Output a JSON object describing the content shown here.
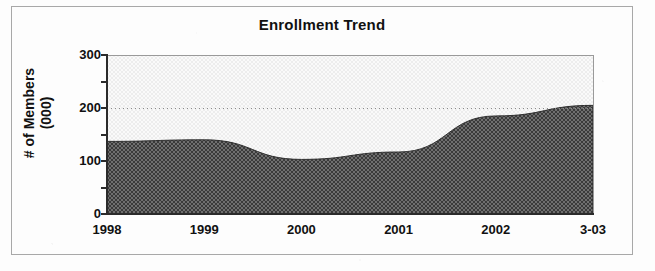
{
  "chart_data": {
    "type": "area",
    "title": "Enrollment Trend",
    "xlabel": "",
    "ylabel_lines": [
      "# of Members",
      "(000)"
    ],
    "ylabel": "# of Members (000)",
    "categories": [
      "1998",
      "1999",
      "2000",
      "2001",
      "2002",
      "3-03"
    ],
    "values": [
      137,
      140,
      103,
      117,
      185,
      205
    ],
    "ylim": [
      0,
      300
    ],
    "y_ticks_major": [
      "0",
      "100",
      "200",
      "300"
    ],
    "y_tick_interval_minor": 50,
    "gridlines": "dotted horizontal at 200",
    "legend": "none",
    "series": [
      {
        "name": "Enrollment",
        "values": [
          137,
          140,
          103,
          117,
          185,
          205
        ]
      }
    ],
    "fill_pattern": "50% checkerboard dither (dark gray)",
    "colors": {
      "area_fill": "#5a5a5a",
      "plot_background": "#f0f0f0",
      "axis": "#2b2b2b",
      "gridline": "#8a8a8a",
      "frame": "#a8a8a8",
      "text": "#111111"
    }
  },
  "figure": {
    "title": "Enrollment Trend",
    "axis_y": {
      "title_line1": "# of Members",
      "title_line2": "(000)",
      "ticks": [
        {
          "label": "300",
          "value": 300
        },
        {
          "label": "200",
          "value": 200
        },
        {
          "label": "100",
          "value": 100
        },
        {
          "label": "0",
          "value": 0
        }
      ]
    },
    "axis_x": {
      "ticks": [
        {
          "label": "1998"
        },
        {
          "label": "1999"
        },
        {
          "label": "2000"
        },
        {
          "label": "2001"
        },
        {
          "label": "2002"
        },
        {
          "label": "3-03"
        }
      ]
    }
  }
}
